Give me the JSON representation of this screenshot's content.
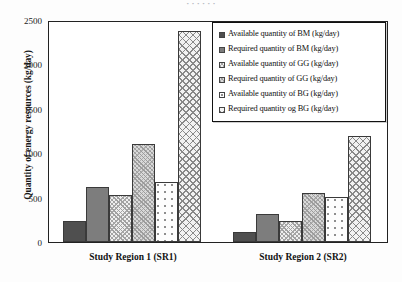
{
  "title_sliver": "· · · · · ·",
  "axes": {
    "ylabel": "Quantity of energy resources (kg/day)",
    "yticks": [
      "0",
      "500",
      "1000",
      "1500",
      "2000",
      "2500"
    ],
    "xlabels": [
      "Study Region 1 (SR1)",
      "Study Region 2 (SR2)"
    ]
  },
  "legend": {
    "items": [
      {
        "label": "Available quantity of BM (kg/day)",
        "pattern": "solid-dark-gray",
        "color": "#4f4f4f"
      },
      {
        "label": "Required quantity of BM (kg/day)",
        "pattern": "solid-medium-gray",
        "color": "#7d7d7d"
      },
      {
        "label": "Available quantity of GG (kg/day)",
        "pattern": "fine-crosshatch-light",
        "color": "#efefef"
      },
      {
        "label": "Required quantity of GG (kg/day)",
        "pattern": "fine-crosshatch-gray",
        "color": "#d9d9d9"
      },
      {
        "label": "Available quantity of BG (kg/day)",
        "pattern": "dotted-white",
        "color": "#fdfdfd"
      },
      {
        "label": "Required quantity og BG (kg/day)",
        "pattern": "coarse-crosshatch",
        "color": "#f2f2f2"
      }
    ]
  },
  "chart_data": {
    "type": "bar",
    "title": "",
    "xlabel": "",
    "ylabel": "Quantity of energy resources (kg/day)",
    "ylim": [
      0,
      2500
    ],
    "ytick_step": 500,
    "grid": false,
    "legend_position": "top-right-inside",
    "categories": [
      "Study Region 1 (SR1)",
      "Study Region 2 (SR2)"
    ],
    "series": [
      {
        "name": "Available quantity of BM (kg/day)",
        "values": [
          235,
          110
        ]
      },
      {
        "name": "Required quantity of BM (kg/day)",
        "values": [
          620,
          310
        ]
      },
      {
        "name": "Available quantity of GG (kg/day)",
        "values": [
          525,
          235
        ]
      },
      {
        "name": "Required quantity of GG (kg/day)",
        "values": [
          1100,
          550
        ]
      },
      {
        "name": "Available quantity of BG (kg/day)",
        "values": [
          680,
          510
        ]
      },
      {
        "name": "Required quantity og BG (kg/day)",
        "values": [
          2375,
          1195
        ]
      }
    ]
  }
}
